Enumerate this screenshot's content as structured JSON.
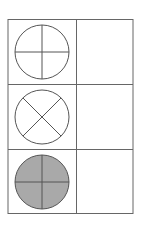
{
  "diagram": {
    "rows": [
      {
        "symbol": "circle-plus",
        "fill": "none",
        "label": ""
      },
      {
        "symbol": "circle-x",
        "fill": "none",
        "label": ""
      },
      {
        "symbol": "circle-plus",
        "fill": "gray",
        "label": ""
      }
    ],
    "colors": {
      "stroke": "#555555",
      "grid": "#666666",
      "fill_gray": "#a9a9a9",
      "background": "#ffffff"
    }
  }
}
